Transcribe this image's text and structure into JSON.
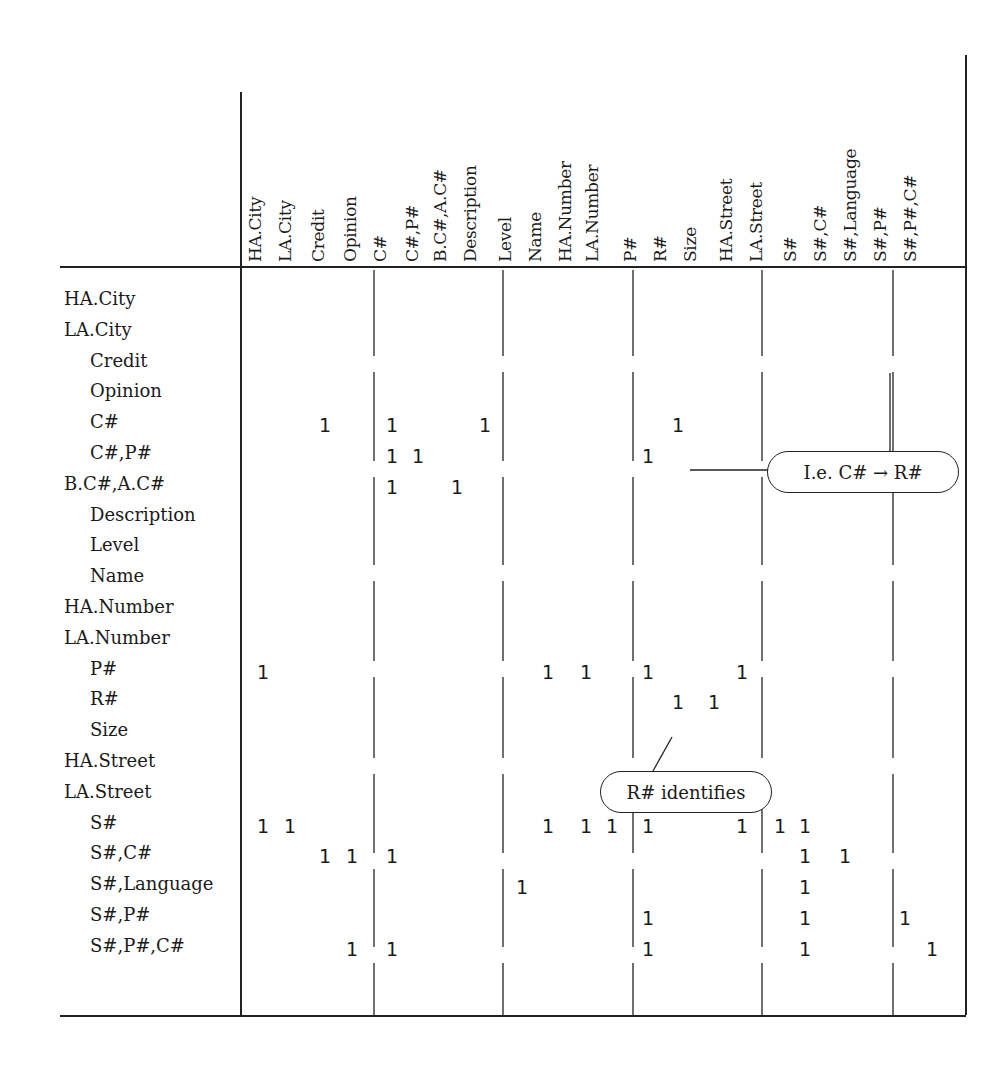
{
  "matrix": {
    "columns": [
      {
        "label": "HA.City",
        "x": 263
      },
      {
        "label": "LA.City",
        "x": 290
      },
      {
        "label": "Credit",
        "x": 325
      },
      {
        "label": "Opinion",
        "x": 352
      },
      {
        "label": "C#",
        "x": 392
      },
      {
        "label": "C#,P#",
        "x": 418
      },
      {
        "label": "B.C#,A.C#",
        "x": 457
      },
      {
        "label": "Description",
        "x": 485
      },
      {
        "label": "Level",
        "x": 522
      },
      {
        "label": "Name",
        "x": 548
      },
      {
        "label": "HA.Number",
        "x": 586
      },
      {
        "label": "LA.Number",
        "x": 612
      },
      {
        "label": "P#",
        "x": 648
      },
      {
        "label": "R#",
        "x": 678
      },
      {
        "label": "Size",
        "x": 714
      },
      {
        "label": "HA.Street",
        "x": 742
      },
      {
        "label": "LA.Street",
        "x": 780
      },
      {
        "label": "S#",
        "x": 805
      },
      {
        "label": "S#,C#",
        "x": 845
      },
      {
        "label": "S#,Language",
        "x": 872
      },
      {
        "label": "S#,P#",
        "x": 905
      },
      {
        "label": "S#,P#,C#",
        "x": 932
      }
    ],
    "header_x": [
      255,
      285,
      318,
      350,
      380,
      412,
      440,
      470,
      505,
      535,
      565,
      592,
      630,
      660,
      690,
      726,
      756,
      790,
      820,
      850,
      880,
      910
    ],
    "rows": [
      {
        "label": "HA.City",
        "indent": false,
        "ones": []
      },
      {
        "label": "LA.City",
        "indent": false,
        "ones": []
      },
      {
        "label": "Credit",
        "indent": true,
        "ones": []
      },
      {
        "label": "Opinion",
        "indent": true,
        "ones": []
      },
      {
        "label": "C#",
        "indent": true,
        "ones": [
          "Credit",
          "C#",
          "Description",
          "R#"
        ]
      },
      {
        "label": "C#,P#",
        "indent": true,
        "ones": [
          "C#",
          "C#,P#",
          "P#"
        ]
      },
      {
        "label": "B.C#,A.C#",
        "indent": false,
        "ones": [
          "C#",
          "B.C#,A.C#"
        ]
      },
      {
        "label": "Description",
        "indent": true,
        "ones": []
      },
      {
        "label": "Level",
        "indent": true,
        "ones": []
      },
      {
        "label": "Name",
        "indent": true,
        "ones": []
      },
      {
        "label": "HA.Number",
        "indent": false,
        "ones": []
      },
      {
        "label": "LA.Number",
        "indent": false,
        "ones": []
      },
      {
        "label": "P#",
        "indent": true,
        "ones": [
          "HA.City",
          "Name",
          "HA.Number",
          "P#",
          "HA.Street"
        ]
      },
      {
        "label": "R#",
        "indent": true,
        "ones": [
          "R#",
          "Size"
        ]
      },
      {
        "label": "Size",
        "indent": true,
        "ones": []
      },
      {
        "label": "HA.Street",
        "indent": false,
        "ones": []
      },
      {
        "label": "LA.Street",
        "indent": false,
        "ones": []
      },
      {
        "label": "S#",
        "indent": true,
        "ones": [
          "HA.City",
          "LA.City",
          "Name",
          "HA.Number",
          "LA.Number",
          "P#",
          "HA.Street",
          "LA.Street",
          "S#"
        ]
      },
      {
        "label": "S#,C#",
        "indent": true,
        "ones": [
          "Credit",
          "Opinion",
          "C#",
          "S#",
          "S#,C#"
        ]
      },
      {
        "label": "S#,Language",
        "indent": true,
        "ones": [
          "Level",
          "S#"
        ]
      },
      {
        "label": "S#,P#",
        "indent": true,
        "ones": [
          "P#",
          "S#",
          "S#,P#"
        ]
      },
      {
        "label": "S#,P#,C#",
        "indent": true,
        "ones": [
          "Opinion",
          "C#",
          "P#",
          "S#",
          "S#,P#,C#"
        ]
      }
    ],
    "cell_value": "1"
  },
  "annotations": {
    "implies": {
      "text": "I.e. C# → R#"
    },
    "identifies": {
      "text": "R# identifies"
    }
  },
  "colors": {
    "ink": "#222222",
    "paper": "#ffffff"
  }
}
